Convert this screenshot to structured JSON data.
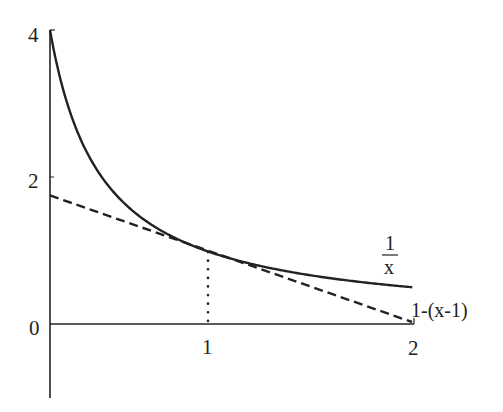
{
  "chart_data": {
    "type": "line",
    "title": "",
    "xlabel": "",
    "ylabel": "",
    "xlim": [
      0.25,
      2
    ],
    "ylim": [
      -1,
      4
    ],
    "grid": false,
    "x_ticks": [
      "1",
      "2"
    ],
    "y_ticks": [
      "4",
      "2",
      "0"
    ],
    "series": [
      {
        "name": "1/x",
        "style": "solid",
        "x": [
          0.25,
          0.3,
          0.4,
          0.5,
          0.6,
          0.75,
          1.0,
          1.25,
          1.5,
          1.75,
          2.0
        ],
        "values": [
          4.0,
          3.333,
          2.5,
          2.0,
          1.667,
          1.333,
          1.0,
          0.8,
          0.667,
          0.571,
          0.5
        ]
      },
      {
        "name": "1-(x-1)",
        "style": "dashed",
        "x": [
          0.25,
          2.0
        ],
        "values": [
          1.75,
          0.0
        ]
      }
    ],
    "annotations": [
      {
        "type": "vertical-dotted-line",
        "x": 1,
        "from_y": 0,
        "to_y": 1
      },
      {
        "type": "label",
        "text_num": "1",
        "text_den": "x",
        "near_series": "1/x"
      },
      {
        "type": "label",
        "text": "1-(x-1)",
        "near_series": "1-(x-1)"
      }
    ]
  },
  "labels": {
    "y4": "4",
    "y2": "2",
    "y0": "0",
    "x1": "1",
    "x2": "2",
    "curve_num": "1",
    "curve_den": "x",
    "tangent": "1-(x-1)"
  },
  "colors": {
    "stroke": "#222222",
    "background": "#ffffff"
  }
}
